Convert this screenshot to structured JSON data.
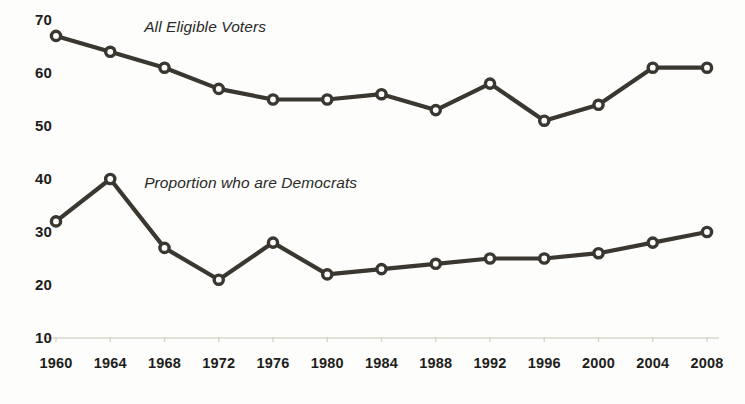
{
  "chart_data": {
    "type": "line",
    "title": "",
    "subtitle": "",
    "xlabel": "",
    "ylabel": "",
    "x": [
      1960,
      1964,
      1968,
      1972,
      1976,
      1980,
      1984,
      1988,
      1992,
      1996,
      2000,
      2004,
      2008
    ],
    "xtick_labels": [
      "1960",
      "1964",
      "1968",
      "1972",
      "1976",
      "1980",
      "1984",
      "1988",
      "1992",
      "1996",
      "2000",
      "2004",
      "2008"
    ],
    "ytick_labels": [
      "70",
      "60",
      "50",
      "40",
      "30",
      "20",
      "10"
    ],
    "yticks": [
      70,
      60,
      50,
      40,
      30,
      20,
      10
    ],
    "ylim": [
      10,
      72
    ],
    "xlim": [
      1958,
      2010
    ],
    "grid": false,
    "legend_position": "inline-annotations",
    "marker": "open-circle",
    "line_color": "#3a3630",
    "marker_fill": "#ffffff",
    "axis_color": "#e2e0d8",
    "series": [
      {
        "name": "All Eligible Voters",
        "label_position": "above-line-left",
        "values": [
          67,
          64,
          61,
          57,
          55,
          55,
          56,
          53,
          58,
          51,
          54,
          61,
          61
        ]
      },
      {
        "name": "Proportion who are Democrats",
        "label_position": "above-line-left",
        "values": [
          32,
          40,
          27,
          21,
          28,
          22,
          23,
          24,
          25,
          25,
          26,
          28,
          30
        ]
      }
    ],
    "annotations": [
      {
        "text": "All Eligible Voters",
        "x": 1966.5,
        "y": 68.5
      },
      {
        "text": "Proportion who are Democrats",
        "x": 1966.5,
        "y": 39.0
      }
    ]
  }
}
